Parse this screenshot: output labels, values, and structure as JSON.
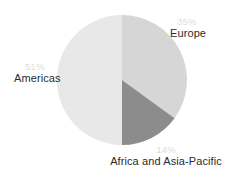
{
  "chart_data": {
    "type": "pie",
    "title": "",
    "subtitle": "",
    "xlabel": "",
    "ylabel": "",
    "legend_position": "none",
    "grid": false,
    "labels_show_percent": true,
    "start_angle_deg": 0,
    "direction": "clockwise",
    "categories": [
      "Europe",
      "Africa and Asia-Pacific",
      "Americas"
    ],
    "values": [
      35,
      14,
      51
    ],
    "slices": [
      {
        "name": "Europe",
        "percent_label": "35%",
        "value": 35,
        "color": "#d6d6d6",
        "start_deg": 0,
        "end_deg": 126
      },
      {
        "name": "Africa and Asia-Pacific",
        "percent_label": "14%",
        "value": 14,
        "color": "#8c8c8c",
        "start_deg": 126,
        "end_deg": 180
      },
      {
        "name": "Americas",
        "percent_label": "51%",
        "value": 51,
        "color": "#e8e8e8",
        "start_deg": 180,
        "end_deg": 360
      }
    ]
  },
  "chart": {
    "center_x": 122,
    "center_y": 80,
    "radius": 65,
    "background": "#ffffff"
  },
  "labels": {
    "europe": {
      "name": "Europe",
      "percent": "35%"
    },
    "americas": {
      "name": "Americas",
      "percent": "51%"
    },
    "africa_asia_pacific": {
      "name": "Africa and Asia-Pacific",
      "percent": "14%"
    }
  }
}
